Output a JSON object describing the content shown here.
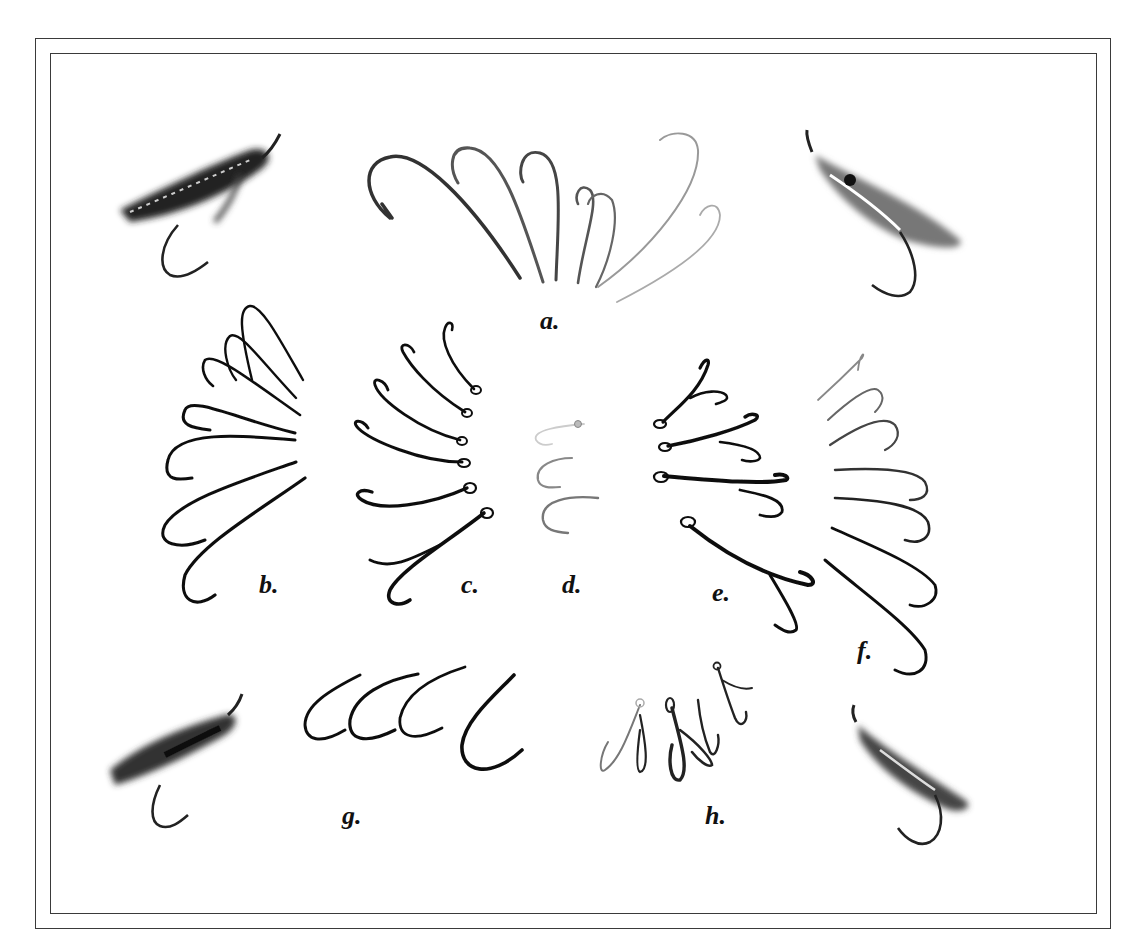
{
  "plate": {
    "type": "illustration-plate",
    "subject": "fishing hook types and salmon flies",
    "colors": {
      "background": "#ffffff",
      "border": "#3a3a3a",
      "ink": "#111111"
    }
  },
  "labels": {
    "a": "a.",
    "b": "b.",
    "c": "c.",
    "d": "d.",
    "e": "e.",
    "f": "f.",
    "g": "g.",
    "h": "h."
  },
  "groups": [
    {
      "id": "a",
      "label": "a.",
      "count": 7,
      "style": "large fan of single hooks, light to dark"
    },
    {
      "id": "b",
      "label": "b.",
      "count": 6,
      "style": "graded single hooks, turned-down shank"
    },
    {
      "id": "c",
      "label": "c.",
      "count": 6,
      "style": "double hooks with looped eye"
    },
    {
      "id": "d",
      "label": "d.",
      "count": 3,
      "style": "small hooks, faint"
    },
    {
      "id": "e",
      "label": "e.",
      "count": 4,
      "style": "double hooks with looped eye, mirrored"
    },
    {
      "id": "f",
      "label": "f.",
      "count": 7,
      "style": "graded single hooks, mirrored of b"
    },
    {
      "id": "g",
      "label": "g.",
      "count": 4,
      "style": "short-shank bent hooks"
    },
    {
      "id": "h",
      "label": "h.",
      "count": 4,
      "style": "small double/treble hooks"
    }
  ],
  "flies": [
    {
      "position": "top-left",
      "name": "salmon-fly"
    },
    {
      "position": "top-right",
      "name": "salmon-fly"
    },
    {
      "position": "bottom-left",
      "name": "salmon-fly"
    },
    {
      "position": "bottom-right",
      "name": "salmon-fly"
    }
  ]
}
